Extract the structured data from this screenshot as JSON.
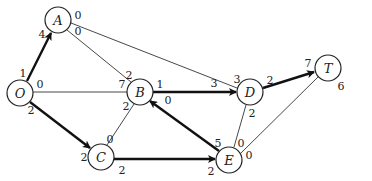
{
  "diagram": {
    "type": "flow-network",
    "nodes": [
      {
        "id": "O",
        "label": "O",
        "x": 20,
        "y": 93
      },
      {
        "id": "A",
        "label": "A",
        "x": 58,
        "y": 20
      },
      {
        "id": "B",
        "label": "B",
        "x": 140,
        "y": 92
      },
      {
        "id": "C",
        "label": "C",
        "x": 101,
        "y": 157
      },
      {
        "id": "D",
        "label": "D",
        "x": 250,
        "y": 92
      },
      {
        "id": "E",
        "label": "E",
        "x": 229,
        "y": 160
      },
      {
        "id": "T",
        "label": "T",
        "x": 328,
        "y": 68
      }
    ],
    "edges": [
      {
        "from": "O",
        "to": "A",
        "style": "bold",
        "arrow": true,
        "from_label": "1",
        "to_label": "4"
      },
      {
        "from": "O",
        "to": "B",
        "style": "thin",
        "arrow": false,
        "from_label": "0",
        "to_label": "7"
      },
      {
        "from": "O",
        "to": "C",
        "style": "bold",
        "arrow": true,
        "from_label": "2",
        "to_label": "2"
      },
      {
        "from": "A",
        "to": "B",
        "style": "thin",
        "arrow": false,
        "from_label": "0",
        "to_label": "2"
      },
      {
        "from": "A",
        "to": "D",
        "style": "thin",
        "arrow": false,
        "from_label": "0",
        "to_label": "3"
      },
      {
        "from": "B",
        "to": "D",
        "style": "bold",
        "arrow": true,
        "from_label": "1",
        "to_label": "3"
      },
      {
        "from": "B",
        "to": "C",
        "style": "thin",
        "arrow": false,
        "from_label": "2",
        "to_label": "0"
      },
      {
        "from": "C",
        "to": "E",
        "style": "bold",
        "arrow": true,
        "from_label": "2",
        "to_label": "2"
      },
      {
        "from": "E",
        "to": "B",
        "style": "bold",
        "arrow": true,
        "from_label": "5",
        "to_label": "0"
      },
      {
        "from": "D",
        "to": "E",
        "style": "thin",
        "arrow": false,
        "from_label": "2",
        "to_label": "0"
      },
      {
        "from": "D",
        "to": "T",
        "style": "bold",
        "arrow": true,
        "from_label": "2",
        "to_label": "7"
      },
      {
        "from": "E",
        "to": "T",
        "style": "thin",
        "arrow": false,
        "from_label": "0",
        "to_label": "6"
      }
    ]
  },
  "labels": {
    "node_O": "O",
    "node_A": "A",
    "node_B": "B",
    "node_C": "C",
    "node_D": "D",
    "node_E": "E",
    "node_T": "T",
    "OA_O": "1",
    "OA_A": "4",
    "OB_O": "0",
    "OB_B": "7",
    "OC_O": "2",
    "OC_C": "2",
    "AB_A": "0",
    "AB_B": "2",
    "AD_A": "0",
    "AD_D": "3",
    "BD_B": "1",
    "BD_D": "3",
    "BC_B": "2",
    "BC_C": "0",
    "CE_C": "2",
    "CE_E": "2",
    "EB_E": "5",
    "EB_B": "0",
    "DE_D": "2",
    "DE_E": "0",
    "DT_D": "2",
    "DT_T": "7",
    "ET_E": "0",
    "ET_T": "6"
  }
}
